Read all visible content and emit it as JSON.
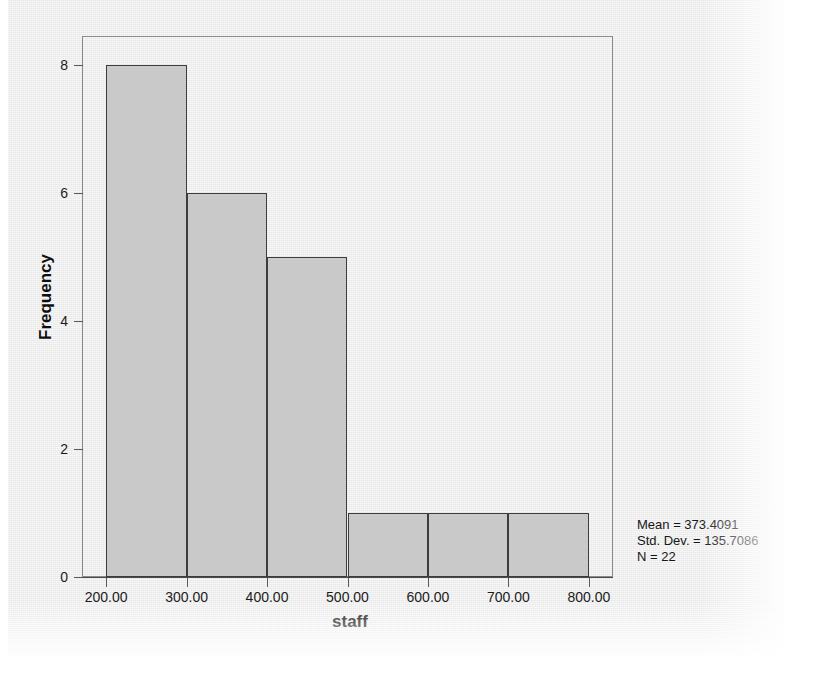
{
  "chart_data": {
    "type": "bar",
    "title": "",
    "subtitle": "",
    "xlabel": "staff",
    "ylabel": "Frequency",
    "categories": [
      "200-300",
      "300-400",
      "400-500",
      "500-600",
      "600-700",
      "700-800"
    ],
    "values": [
      8,
      6,
      5,
      1,
      1,
      1
    ],
    "bin_edges": [
      200,
      300,
      400,
      500,
      600,
      700,
      800
    ],
    "bin_width": 100,
    "xlim": [
      170,
      830
    ],
    "ylim": [
      0,
      8.45
    ],
    "xticks": [
      200,
      300,
      400,
      500,
      600,
      700,
      800
    ],
    "xtick_labels": [
      "200.00",
      "300.00",
      "400.00",
      "500.00",
      "600.00",
      "700.00",
      "800.00"
    ],
    "yticks": [
      0,
      2,
      4,
      6,
      8
    ],
    "ytick_labels": [
      "0",
      "2",
      "4",
      "6",
      "8"
    ],
    "grid": false,
    "legend": false,
    "bar_fill_color": "#c9c9c9",
    "bar_edge_color": "#3c3c3c",
    "frame_color": "#8a8a8a",
    "background_color": "#ececec",
    "annotations": {
      "mean_label": "Mean = 373.4091",
      "std_dev_label": "Std. Dev. = 135.7086",
      "n_label": "N = 22",
      "mean": 373.4091,
      "std_dev": 135.7086,
      "n": 22,
      "position": "bottom-right"
    }
  }
}
